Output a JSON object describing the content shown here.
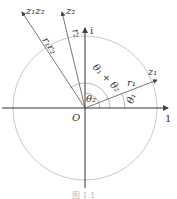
{
  "labels": {
    "z1z2": "z₁z₂",
    "z2": "z₂",
    "z1": "z₁",
    "r1r2": "r₁r₂",
    "r2": "r₂",
    "r1": "r₁",
    "theta1": "θ₁",
    "theta2": "θ₂",
    "theta_sum": "θ₁ + θ₂",
    "origin": "O",
    "real_unit": "1",
    "imag_unit": "i"
  },
  "caption": "图 1.1",
  "colors": {
    "axis": "#333333",
    "circle": "#bbbbbb",
    "vector": "#555555"
  }
}
